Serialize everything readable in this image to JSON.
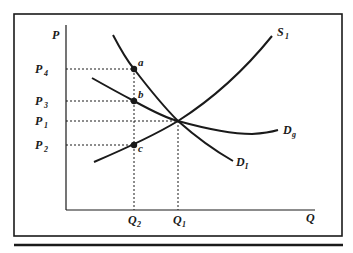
{
  "diagram": {
    "type": "supply-demand",
    "axes": {
      "y_label": "P",
      "x_label": "Q"
    },
    "price_levels": [
      {
        "id": "P4",
        "main": "P",
        "sub": "4",
        "y": 69
      },
      {
        "id": "P3",
        "main": "P",
        "sub": "3",
        "y": 101
      },
      {
        "id": "P1",
        "main": "P",
        "sub": "1",
        "y": 121
      },
      {
        "id": "P2",
        "main": "P",
        "sub": "2",
        "y": 145
      }
    ],
    "quantity_levels": [
      {
        "id": "Q2",
        "main": "Q",
        "sub": "2",
        "x": 134
      },
      {
        "id": "Q1",
        "main": "Q",
        "sub": "1",
        "x": 178
      }
    ],
    "curves": [
      {
        "id": "S1",
        "main": "S",
        "sub": "1",
        "kind": "supply"
      },
      {
        "id": "DI",
        "main": "D",
        "sub": "I",
        "kind": "demand"
      },
      {
        "id": "Dg",
        "main": "D",
        "sub": "g",
        "kind": "demand"
      }
    ],
    "points": [
      {
        "id": "a",
        "label": "a"
      },
      {
        "id": "b",
        "label": "b"
      },
      {
        "id": "c",
        "label": "c"
      }
    ],
    "colors": {
      "ink": "#1a1a1a",
      "background": "#ffffff"
    }
  }
}
